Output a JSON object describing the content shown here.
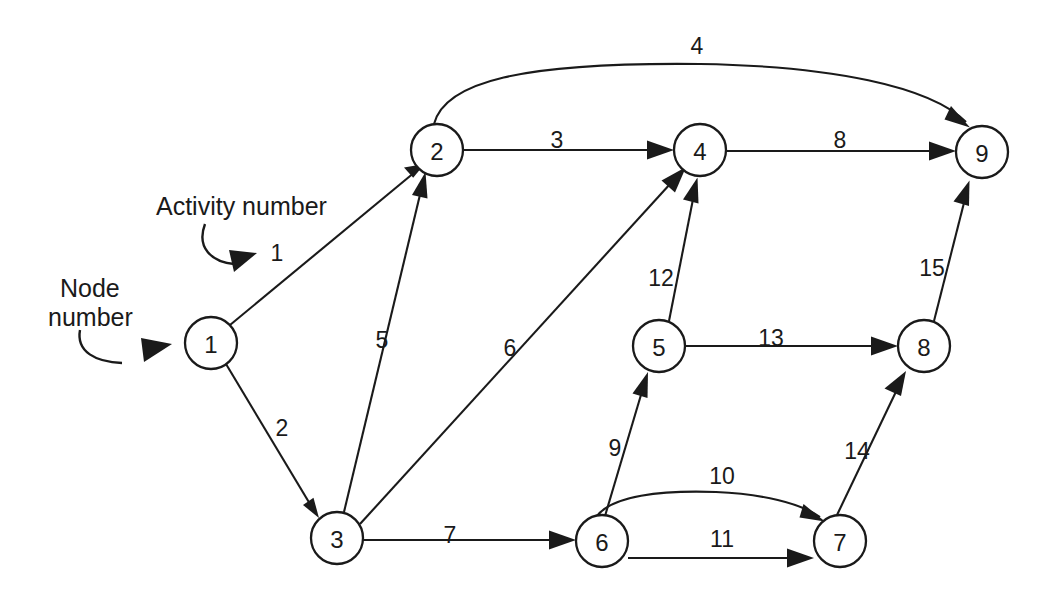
{
  "diagram": {
    "type": "directed-network-graph",
    "stroke_color": "#1a1a1a",
    "background_color": "#ffffff",
    "nodes": [
      {
        "id": "1",
        "label": "1",
        "cx": 211,
        "cy": 343,
        "r": 26
      },
      {
        "id": "2",
        "label": "2",
        "cx": 437,
        "cy": 150,
        "r": 26
      },
      {
        "id": "3",
        "label": "3",
        "cx": 337,
        "cy": 538,
        "r": 26
      },
      {
        "id": "4",
        "label": "4",
        "cx": 700,
        "cy": 150,
        "r": 26
      },
      {
        "id": "5",
        "label": "5",
        "cx": 659,
        "cy": 346,
        "r": 26
      },
      {
        "id": "6",
        "label": "6",
        "cx": 602,
        "cy": 541,
        "r": 26
      },
      {
        "id": "7",
        "label": "7",
        "cx": 840,
        "cy": 541,
        "r": 26
      },
      {
        "id": "8",
        "label": "8",
        "cx": 924,
        "cy": 346,
        "r": 26
      },
      {
        "id": "9",
        "label": "9",
        "cx": 982,
        "cy": 152,
        "r": 26
      }
    ],
    "edges": [
      {
        "activity": "1",
        "from": "1",
        "to": "2",
        "label": "1",
        "label_x": 277,
        "label_y": 253,
        "shape": "straight"
      },
      {
        "activity": "2",
        "from": "1",
        "to": "3",
        "label": "2",
        "label_x": 282,
        "label_y": 428,
        "shape": "straight"
      },
      {
        "activity": "3",
        "from": "2",
        "to": "4",
        "label": "3",
        "label_x": 557,
        "label_y": 140,
        "shape": "straight"
      },
      {
        "activity": "4",
        "from": "2",
        "to": "9",
        "label": "4",
        "label_x": 697,
        "label_y": 46,
        "shape": "curved"
      },
      {
        "activity": "5",
        "from": "3",
        "to": "2",
        "label": "5",
        "label_x": 382,
        "label_y": 340,
        "shape": "straight"
      },
      {
        "activity": "6",
        "from": "3",
        "to": "4",
        "label": "6",
        "label_x": 510,
        "label_y": 348,
        "shape": "straight"
      },
      {
        "activity": "7",
        "from": "3",
        "to": "6",
        "label": "7",
        "label_x": 450,
        "label_y": 535,
        "shape": "straight"
      },
      {
        "activity": "8",
        "from": "4",
        "to": "9",
        "label": "8",
        "label_x": 840,
        "label_y": 140,
        "shape": "straight"
      },
      {
        "activity": "9",
        "from": "6",
        "to": "5",
        "label": "9",
        "label_x": 615,
        "label_y": 448,
        "shape": "straight"
      },
      {
        "activity": "10",
        "from": "6",
        "to": "7",
        "label": "10",
        "label_x": 722,
        "label_y": 476,
        "shape": "curved"
      },
      {
        "activity": "11",
        "from": "6",
        "to": "7",
        "label": "11",
        "label_x": 722,
        "label_y": 539,
        "shape": "straight"
      },
      {
        "activity": "12",
        "from": "5",
        "to": "4",
        "label": "12",
        "label_x": 661,
        "label_y": 278,
        "shape": "straight"
      },
      {
        "activity": "13",
        "from": "5",
        "to": "8",
        "label": "13",
        "label_x": 771,
        "label_y": 338,
        "shape": "straight"
      },
      {
        "activity": "14",
        "from": "7",
        "to": "8",
        "label": "14",
        "label_x": 857,
        "label_y": 451,
        "shape": "straight"
      },
      {
        "activity": "15",
        "from": "8",
        "to": "9",
        "label": "15",
        "label_x": 932,
        "label_y": 268,
        "shape": "straight"
      }
    ],
    "annotations": [
      {
        "name": "activity-number",
        "text": "Activity number",
        "text_x": 156,
        "text_y": 206,
        "lines": [
          "Activity number"
        ]
      },
      {
        "name": "node-number",
        "text": "Node number",
        "text_x": 60,
        "text_y": 288,
        "lines": [
          "Node",
          "number"
        ]
      }
    ]
  }
}
